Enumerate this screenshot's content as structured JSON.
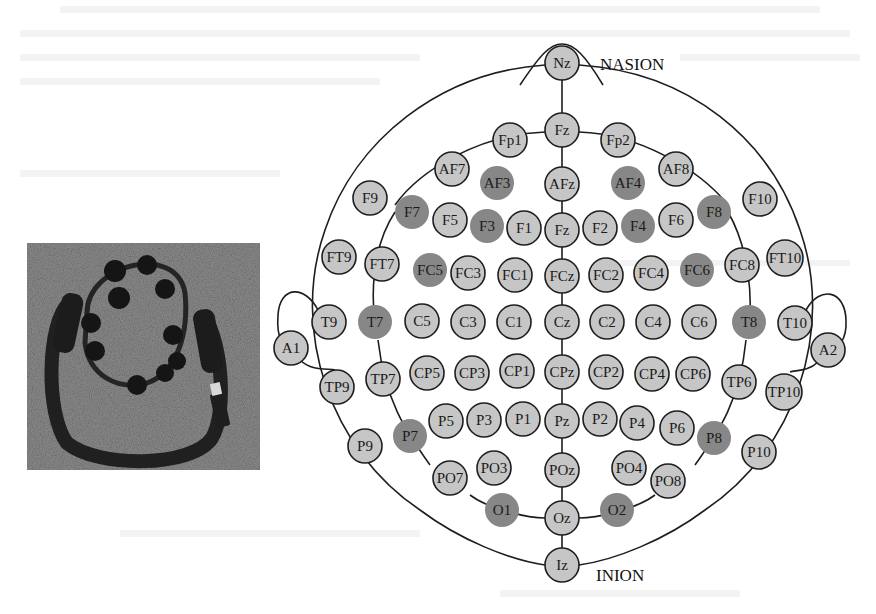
{
  "figure": {
    "photo": {
      "subject": "wireless EEG headset with USB dongle"
    },
    "landmarks": {
      "nasion": "NASION",
      "inion": "INION"
    },
    "colors": {
      "electrode_default": "#c6c6c6",
      "electrode_highlight": "#878787",
      "stroke": "#1e1e1e",
      "photo_bg": "#8e8e8e"
    },
    "electrodes": [
      {
        "label": "Nz",
        "x": 562,
        "y": 63,
        "hl": false
      },
      {
        "label": "Fz",
        "x": 562,
        "y": 130,
        "hl": false
      },
      {
        "label": "Fp1",
        "x": 510,
        "y": 140,
        "hl": false
      },
      {
        "label": "Fp2",
        "x": 618,
        "y": 140,
        "hl": false
      },
      {
        "label": "AF7",
        "x": 452,
        "y": 169,
        "hl": false
      },
      {
        "label": "AF3",
        "x": 497,
        "y": 183,
        "hl": true
      },
      {
        "label": "AFz",
        "x": 562,
        "y": 184,
        "hl": false
      },
      {
        "label": "AF4",
        "x": 628,
        "y": 183,
        "hl": true
      },
      {
        "label": "AF8",
        "x": 676,
        "y": 169,
        "hl": false
      },
      {
        "label": "F9",
        "x": 370,
        "y": 198,
        "hl": false
      },
      {
        "label": "F7",
        "x": 412,
        "y": 212,
        "hl": true
      },
      {
        "label": "F5",
        "x": 450,
        "y": 220,
        "hl": false
      },
      {
        "label": "F3",
        "x": 487,
        "y": 226,
        "hl": true
      },
      {
        "label": "F1",
        "x": 524,
        "y": 228,
        "hl": false
      },
      {
        "label": "Fz",
        "x": 562,
        "y": 230,
        "hl": false
      },
      {
        "label": "F2",
        "x": 600,
        "y": 228,
        "hl": false
      },
      {
        "label": "F4",
        "x": 638,
        "y": 226,
        "hl": true
      },
      {
        "label": "F6",
        "x": 676,
        "y": 220,
        "hl": false
      },
      {
        "label": "F8",
        "x": 714,
        "y": 212,
        "hl": true
      },
      {
        "label": "F10",
        "x": 760,
        "y": 199,
        "hl": false
      },
      {
        "label": "FT9",
        "x": 339,
        "y": 257,
        "hl": false
      },
      {
        "label": "FT7",
        "x": 382,
        "y": 264,
        "hl": false
      },
      {
        "label": "FC5",
        "x": 430,
        "y": 270,
        "hl": true
      },
      {
        "label": "FC3",
        "x": 468,
        "y": 273,
        "hl": false
      },
      {
        "label": "FC1",
        "x": 515,
        "y": 275,
        "hl": false
      },
      {
        "label": "FCz",
        "x": 562,
        "y": 276,
        "hl": false
      },
      {
        "label": "FC2",
        "x": 606,
        "y": 275,
        "hl": false
      },
      {
        "label": "FC4",
        "x": 651,
        "y": 273,
        "hl": false
      },
      {
        "label": "FC6",
        "x": 697,
        "y": 270,
        "hl": true
      },
      {
        "label": "FC8",
        "x": 742,
        "y": 265,
        "hl": false
      },
      {
        "label": "FT10",
        "x": 785,
        "y": 258,
        "hl": false
      },
      {
        "label": "A1",
        "x": 291,
        "y": 348,
        "hl": false
      },
      {
        "label": "T9",
        "x": 329,
        "y": 322,
        "hl": false
      },
      {
        "label": "T7",
        "x": 375,
        "y": 322,
        "hl": true
      },
      {
        "label": "C5",
        "x": 422,
        "y": 321,
        "hl": false
      },
      {
        "label": "C3",
        "x": 468,
        "y": 322,
        "hl": false
      },
      {
        "label": "C1",
        "x": 514,
        "y": 322,
        "hl": false
      },
      {
        "label": "Cz",
        "x": 562,
        "y": 322,
        "hl": false
      },
      {
        "label": "C2",
        "x": 607,
        "y": 322,
        "hl": false
      },
      {
        "label": "C4",
        "x": 653,
        "y": 322,
        "hl": false
      },
      {
        "label": "C6",
        "x": 699,
        "y": 322,
        "hl": false
      },
      {
        "label": "T8",
        "x": 749,
        "y": 322,
        "hl": true
      },
      {
        "label": "T10",
        "x": 795,
        "y": 323,
        "hl": false
      },
      {
        "label": "A2",
        "x": 828,
        "y": 350,
        "hl": false
      },
      {
        "label": "TP9",
        "x": 337,
        "y": 387,
        "hl": false
      },
      {
        "label": "TP7",
        "x": 383,
        "y": 379,
        "hl": false
      },
      {
        "label": "CP5",
        "x": 427,
        "y": 373,
        "hl": false
      },
      {
        "label": "CP3",
        "x": 472,
        "y": 373,
        "hl": false
      },
      {
        "label": "CP1",
        "x": 517,
        "y": 371,
        "hl": false
      },
      {
        "label": "CPz",
        "x": 562,
        "y": 372,
        "hl": false
      },
      {
        "label": "CP2",
        "x": 606,
        "y": 372,
        "hl": false
      },
      {
        "label": "CP4",
        "x": 652,
        "y": 374,
        "hl": false
      },
      {
        "label": "CP6",
        "x": 693,
        "y": 374,
        "hl": false
      },
      {
        "label": "TP6",
        "x": 739,
        "y": 382,
        "hl": false
      },
      {
        "label": "TP10",
        "x": 784,
        "y": 392,
        "hl": false
      },
      {
        "label": "P9",
        "x": 365,
        "y": 446,
        "hl": false
      },
      {
        "label": "P7",
        "x": 410,
        "y": 436,
        "hl": true
      },
      {
        "label": "P5",
        "x": 446,
        "y": 421,
        "hl": false
      },
      {
        "label": "P3",
        "x": 484,
        "y": 420,
        "hl": false
      },
      {
        "label": "P1",
        "x": 523,
        "y": 419,
        "hl": false
      },
      {
        "label": "Pz",
        "x": 562,
        "y": 421,
        "hl": false
      },
      {
        "label": "P2",
        "x": 600,
        "y": 419,
        "hl": false
      },
      {
        "label": "P4",
        "x": 637,
        "y": 423,
        "hl": false
      },
      {
        "label": "P6",
        "x": 677,
        "y": 428,
        "hl": false
      },
      {
        "label": "P8",
        "x": 714,
        "y": 438,
        "hl": true
      },
      {
        "label": "P10",
        "x": 759,
        "y": 452,
        "hl": false
      },
      {
        "label": "PO7",
        "x": 450,
        "y": 478,
        "hl": false
      },
      {
        "label": "PO3",
        "x": 494,
        "y": 468,
        "hl": false
      },
      {
        "label": "POz",
        "x": 562,
        "y": 470,
        "hl": false
      },
      {
        "label": "PO4",
        "x": 629,
        "y": 468,
        "hl": false
      },
      {
        "label": "PO8",
        "x": 668,
        "y": 481,
        "hl": false
      },
      {
        "label": "O1",
        "x": 502,
        "y": 510,
        "hl": true
      },
      {
        "label": "Oz",
        "x": 562,
        "y": 518,
        "hl": false
      },
      {
        "label": "O2",
        "x": 617,
        "y": 510,
        "hl": true
      },
      {
        "label": "Iz",
        "x": 562,
        "y": 565,
        "hl": false
      }
    ]
  }
}
